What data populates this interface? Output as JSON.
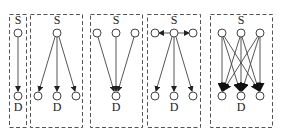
{
  "diagram": {
    "panels": [
      {
        "id": "one-to-one",
        "source_label": "S",
        "dest_label": "D",
        "sources": 1,
        "destinations": 1,
        "pattern": "single source to single destination"
      },
      {
        "id": "one-to-many",
        "source_label": "S",
        "dest_label": "D",
        "sources": 1,
        "destinations": 3,
        "pattern": "one source fans out to three destinations"
      },
      {
        "id": "many-to-one",
        "source_label": "S",
        "dest_label": "D",
        "sources": 3,
        "destinations": 1,
        "pattern": "three sources converge to one destination"
      },
      {
        "id": "relay-one-to-many",
        "source_label": "S",
        "dest_label": "D",
        "sources": 3,
        "destinations": 3,
        "pattern": "side sources feed central source which fans out to three destinations"
      },
      {
        "id": "many-to-many",
        "source_label": "S",
        "dest_label": "D",
        "sources": 3,
        "destinations": 3,
        "pattern": "each source connects to every destination"
      }
    ]
  }
}
